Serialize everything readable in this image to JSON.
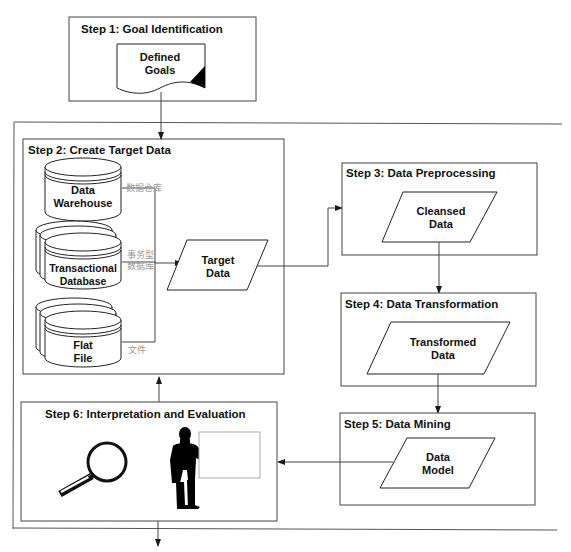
{
  "diagram": {
    "type": "flowchart",
    "steps": [
      {
        "id": "step1",
        "label": "Step 1: Goal Identification",
        "items": [
          {
            "shape": "document",
            "text_line1": "Defined",
            "text_line2": "Goals"
          }
        ]
      },
      {
        "id": "step2",
        "label": "Step 2: Create Target Data",
        "items": [
          {
            "shape": "database",
            "text_line1": "Data",
            "text_line2": "Warehouse",
            "annotation": "数据仓库"
          },
          {
            "shape": "stacked-database",
            "text_line1": "Transactional",
            "text_line2": "Database",
            "annotation_line1": "事务型",
            "annotation_line2": "数据库"
          },
          {
            "shape": "stacked-database",
            "text_line1": "Flat",
            "text_line2": "File",
            "annotation": "文件"
          },
          {
            "shape": "parallelogram",
            "text_line1": "Target",
            "text_line2": "Data"
          }
        ]
      },
      {
        "id": "step3",
        "label": "Step 3: Data Preprocessing",
        "items": [
          {
            "shape": "parallelogram",
            "text_line1": "Cleansed",
            "text_line2": "Data"
          }
        ]
      },
      {
        "id": "step4",
        "label": "Step 4: Data Transformation",
        "items": [
          {
            "shape": "parallelogram",
            "text_line1": "Transformed",
            "text_line2": "Data"
          }
        ]
      },
      {
        "id": "step5",
        "label": "Step 5: Data Mining",
        "items": [
          {
            "shape": "parallelogram",
            "text_line1": "Data",
            "text_line2": "Model"
          }
        ]
      },
      {
        "id": "step6",
        "label": "Step 6: Interpretation and Evaluation",
        "items": [
          {
            "shape": "magnifying-glass"
          },
          {
            "shape": "presenter-with-board"
          }
        ]
      }
    ],
    "flows": [
      {
        "from": "step1",
        "to": "step2"
      },
      {
        "from": "step2.sources",
        "to": "step2.target_data"
      },
      {
        "from": "step2.target_data",
        "to": "step3"
      },
      {
        "from": "step3",
        "to": "step4"
      },
      {
        "from": "step4",
        "to": "step5"
      },
      {
        "from": "step5",
        "to": "step6"
      },
      {
        "from": "step6",
        "to": "step2"
      },
      {
        "from": "step6",
        "to": "exit"
      }
    ],
    "colors": {
      "line": "#1a1a1a",
      "frame": "#555555",
      "annotation": "#9a9a9a",
      "background": "#ffffff"
    }
  }
}
